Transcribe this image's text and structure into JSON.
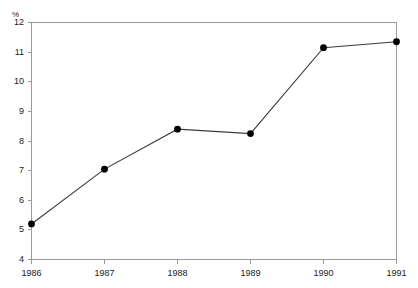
{
  "chart_data": {
    "type": "line",
    "title": "",
    "subtitle": "",
    "xlabel": "",
    "ylabel": "",
    "unit_label": "%",
    "categories": [
      "1986",
      "1987",
      "1988",
      "1989",
      "1990",
      "1991"
    ],
    "x": [
      1986,
      1987,
      1988,
      1989,
      1990,
      1991
    ],
    "values": [
      5.2,
      7.05,
      8.4,
      8.25,
      11.15,
      11.35
    ],
    "series": [
      {
        "name": "",
        "values": [
          5.2,
          7.05,
          8.4,
          8.25,
          11.15,
          11.35
        ]
      }
    ],
    "ylim": [
      4,
      12
    ],
    "yticks": [
      4,
      5,
      6,
      7,
      8,
      9,
      10,
      11,
      12
    ],
    "ytick_labels": [
      "4",
      "5",
      "6",
      "7",
      "8",
      "9",
      "10",
      "11",
      "12"
    ],
    "xlim": [
      1986,
      1991
    ],
    "xtick_labels": [
      "1986",
      "1987",
      "1988",
      "1989",
      "1990",
      "1991"
    ],
    "grid": false,
    "legend": "none",
    "marker": "filled-circle",
    "line_color": "#3b3b3b",
    "marker_color": "#000000",
    "frame_color": "#9a9a9a",
    "text_color": "#1a1a1a",
    "background_color": "#ffffff"
  }
}
